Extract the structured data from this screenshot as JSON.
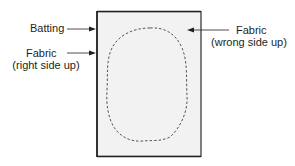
{
  "diagram": {
    "labels": {
      "batting": "Batting",
      "fabric_right": {
        "line1": "Fabric",
        "line2": "(right side up)"
      },
      "fabric_wrong": {
        "line1": "Fabric",
        "line2": "(wrong side up)"
      }
    },
    "colors": {
      "background": "#ffffff",
      "panel_fill": "#f2f2f2",
      "outline": "#231f20",
      "stitch_line": "#555555"
    }
  }
}
